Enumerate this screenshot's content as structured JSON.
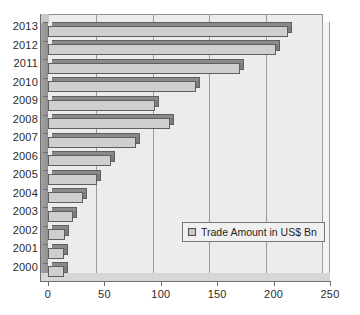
{
  "chart_data": {
    "type": "bar",
    "orientation": "horizontal",
    "title": "",
    "xlabel": "",
    "ylabel": "",
    "xlim": [
      0,
      250
    ],
    "ylim": null,
    "grid": true,
    "legend_position": "inside-right",
    "legend": [
      "Trade Amount in US$ Bn"
    ],
    "categories": [
      "2013",
      "2012",
      "2011",
      "2010",
      "2009",
      "2008",
      "2007",
      "2006",
      "2005",
      "2004",
      "2003",
      "2002",
      "2001",
      "2000"
    ],
    "values": [
      213,
      202,
      170,
      131,
      95,
      108,
      78,
      56,
      43,
      31,
      22,
      15,
      14,
      14
    ],
    "series": [
      {
        "name": "Trade Amount in US$ Bn",
        "values": [
          213,
          202,
          170,
          131,
          95,
          108,
          78,
          56,
          43,
          31,
          22,
          15,
          14,
          14
        ]
      }
    ],
    "xticks": [
      0,
      50,
      100,
      150,
      200,
      250
    ],
    "xtick_labels": [
      "0",
      "50",
      "100",
      "150",
      "200",
      "250"
    ],
    "ytick_labels": [
      "2013",
      "2012",
      "2011",
      "2010",
      "2009",
      "2008",
      "2007",
      "2006",
      "2005",
      "2004",
      "2003",
      "2002",
      "2001",
      "2000"
    ],
    "colors": {
      "bar_fill": "#cfcfcf",
      "bar_edge": "#5f5f5f",
      "bar_top": "#8a8a8a",
      "bar_side": "#7d7d7d",
      "plot_background": "#ececec",
      "gridline": "#9b9b9b",
      "axis": "#6f6f6f",
      "text": "#2b2b2b",
      "legend_background": "#f0f0f0"
    }
  },
  "legend": {
    "entry_label": "Trade Amount in US$ Bn",
    "swatch_icon": "square-swatch-icon"
  }
}
